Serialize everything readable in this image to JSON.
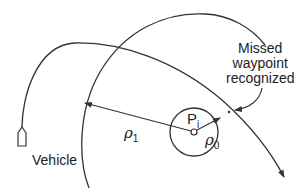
{
  "diagram": {
    "labels": {
      "callout_line1": "Missed",
      "callout_line2": "waypoint",
      "callout_line3": "recognized",
      "vehicle": "Vehicle",
      "waypoint": "P",
      "waypoint_sub": "i",
      "rho1": "ρ",
      "rho1_sub": "1",
      "rho0": "ρ",
      "rho0_sub": "0"
    },
    "elements": {
      "vehicle_path": "curved trajectory from vehicle with arrowhead",
      "outer_arc": "large arc of radius ρ1 centered at waypoint",
      "inner_circle": "small acceptance circle of radius ρ0 around waypoint",
      "vehicle_icon": "boat-shaped vehicle outline",
      "callout_arrow": "curved arrow pointing to crossing point"
    },
    "colors": {
      "stroke": "#333333",
      "text": "#222222",
      "background": "#ffffff"
    }
  }
}
